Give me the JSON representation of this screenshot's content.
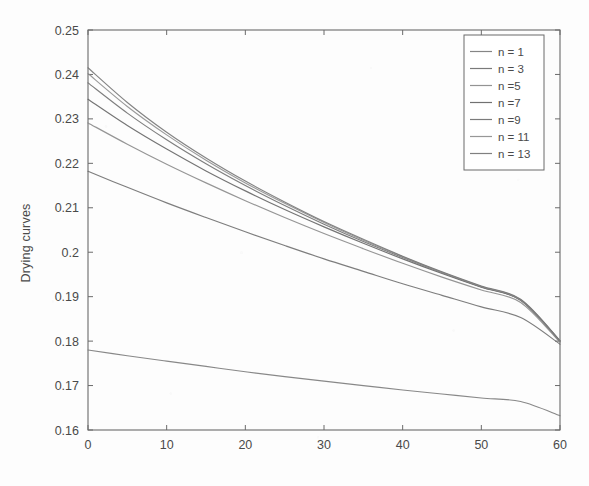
{
  "figure": {
    "background_color": "#fdfdfd",
    "axis_color": "#6b6b6b",
    "text_color": "#4a4a4a"
  },
  "axes": {
    "ylabel": "Drying curves",
    "xlabel": "",
    "title": "",
    "x_ticks": [
      "0",
      "10",
      "20",
      "30",
      "40",
      "50",
      "60"
    ],
    "y_ticks": [
      "0.16",
      "0.17",
      "0.18",
      "0.19",
      "0.2",
      "0.21",
      "0.22",
      "0.23",
      "0.24",
      "0.25"
    ]
  },
  "legend": {
    "position": "top-right",
    "entries": [
      {
        "label": "n = 1",
        "color": "#7b7b7b"
      },
      {
        "label": "n = 3",
        "color": "#6f6f6f"
      },
      {
        "label": "n =5",
        "color": "#8a8a8a"
      },
      {
        "label": "n =7",
        "color": "#656565"
      },
      {
        "label": "n =9",
        "color": "#707070"
      },
      {
        "label": "n = 11",
        "color": "#8f8f8f"
      },
      {
        "label": "n = 13",
        "color": "#767676"
      }
    ]
  },
  "chart_data": {
    "type": "line",
    "title": "",
    "xlabel": "",
    "ylabel": "Drying curves",
    "xlim": [
      0,
      60
    ],
    "ylim": [
      0.16,
      0.25
    ],
    "xticks": [
      0,
      10,
      20,
      30,
      40,
      50,
      60
    ],
    "yticks": [
      0.16,
      0.17,
      0.18,
      0.19,
      0.2,
      0.21,
      0.22,
      0.23,
      0.24,
      0.25
    ],
    "grid": false,
    "legend_position": "top-right",
    "x": [
      0,
      5,
      10,
      15,
      20,
      25,
      30,
      35,
      40,
      45,
      50,
      55,
      60
    ],
    "series": [
      {
        "name": "n = 1",
        "color": "#7b7b7b",
        "values": [
          0.178,
          0.1767,
          0.1755,
          0.1743,
          0.1731,
          0.172,
          0.171,
          0.17,
          0.169,
          0.1681,
          0.1672,
          0.1664,
          0.1632
        ]
      },
      {
        "name": "n = 3",
        "color": "#6f6f6f",
        "values": [
          0.2182,
          0.2146,
          0.2111,
          0.2078,
          0.2046,
          0.2015,
          0.1985,
          0.1957,
          0.1929,
          0.1903,
          0.1877,
          0.1853,
          0.1793
        ]
      },
      {
        "name": "n =5",
        "color": "#8a8a8a",
        "values": [
          0.2291,
          0.2243,
          0.2198,
          0.2156,
          0.2116,
          0.2078,
          0.2042,
          0.2008,
          0.1975,
          0.1944,
          0.1915,
          0.1887,
          0.1797
        ]
      },
      {
        "name": "n =7",
        "color": "#656565",
        "values": [
          0.2344,
          0.2285,
          0.2232,
          0.2183,
          0.2138,
          0.2096,
          0.2057,
          0.202,
          0.1985,
          0.1952,
          0.1921,
          0.1892,
          0.18
        ]
      },
      {
        "name": "n =9",
        "color": "#707070",
        "values": [
          0.2381,
          0.2313,
          0.2253,
          0.2199,
          0.215,
          0.2105,
          0.2063,
          0.2024,
          0.1988,
          0.1954,
          0.1922,
          0.1892,
          0.18
        ]
      },
      {
        "name": "n = 11",
        "color": "#8f8f8f",
        "values": [
          0.2402,
          0.2328,
          0.2264,
          0.2207,
          0.2156,
          0.211,
          0.2067,
          0.2027,
          0.199,
          0.1955,
          0.1923,
          0.1893,
          0.18
        ]
      },
      {
        "name": "n = 13",
        "color": "#767676",
        "values": [
          0.2415,
          0.2337,
          0.227,
          0.2212,
          0.216,
          0.2113,
          0.2069,
          0.2029,
          0.1991,
          0.1956,
          0.1924,
          0.1894,
          0.1801
        ]
      }
    ]
  }
}
